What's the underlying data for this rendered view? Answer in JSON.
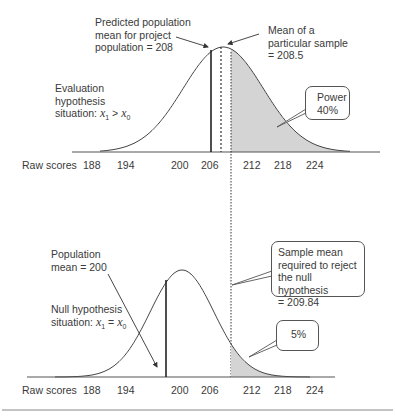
{
  "chart_data": [
    {
      "type": "area",
      "title": "Evaluation hypothesis situation",
      "condition": {
        "prefix": "situation: ",
        "lhs": "x",
        "lhs_sub": "1",
        "op": ">",
        "rhs": "x",
        "rhs_sub": "0"
      },
      "label_line1": "Evaluation",
      "label_line2": "hypothesis",
      "distribution": {
        "kind": "normal",
        "mean": 208
      },
      "xlabel": "Raw scores",
      "ticks": [
        "188",
        "194",
        "200",
        "206",
        "212",
        "218",
        "224"
      ],
      "shaded_region": {
        "from": 209.84,
        "label": "Power",
        "value": "40%"
      },
      "annotations": {
        "predicted_mean": [
          "Predicted population",
          "mean for project",
          "population = 208"
        ],
        "sample_mean": [
          "Mean of a",
          "particular sample",
          "= 208.5"
        ]
      },
      "sample_mean": 208.5
    },
    {
      "type": "area",
      "title": "Null hypothesis situation",
      "condition": {
        "prefix": "situation: ",
        "lhs": "x",
        "lhs_sub": "1",
        "op": "=",
        "rhs": "x",
        "rhs_sub": "0"
      },
      "label_line1": "Null hypothesis",
      "distribution": {
        "kind": "normal",
        "mean": 200
      },
      "xlabel": "Raw scores",
      "ticks": [
        "188",
        "194",
        "200",
        "206",
        "212",
        "218",
        "224"
      ],
      "shaded_region": {
        "from": 209.84,
        "value": "5%"
      },
      "annotations": {
        "population_mean": [
          "Population",
          "mean = 200"
        ],
        "critical": [
          "Sample mean",
          "required to reject",
          "the null hypothesis",
          "= 209.84"
        ]
      }
    }
  ]
}
